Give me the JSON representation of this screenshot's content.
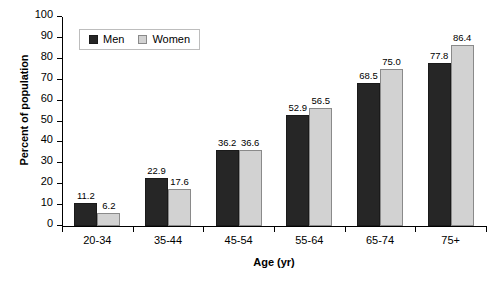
{
  "chart_data": {
    "type": "bar",
    "title": "",
    "subtitle": "",
    "xlabel": "Age (yr)",
    "ylabel": "Percent of population",
    "categories": [
      "20-34",
      "35-44",
      "45-54",
      "55-64",
      "65-74",
      "75+"
    ],
    "series": [
      {
        "name": "Men",
        "color": "#262626",
        "values": [
          11.2,
          22.9,
          36.2,
          52.9,
          68.5,
          77.8
        ]
      },
      {
        "name": "Women",
        "color": "#d2d2d2",
        "values": [
          6.2,
          17.6,
          36.6,
          56.5,
          75.0,
          86.4
        ]
      }
    ],
    "value_labels": {
      "Men": [
        "11.2",
        "22.9",
        "36.2",
        "52.9",
        "68.5",
        "77.8"
      ],
      "Women": [
        "6.2",
        "17.6",
        "36.6",
        "56.5",
        "75.0",
        "86.4"
      ]
    },
    "ylim": [
      0,
      100
    ],
    "ytick_values": [
      0,
      10,
      20,
      30,
      40,
      50,
      60,
      70,
      80,
      90,
      100
    ],
    "ytick_labels": [
      "0",
      "10",
      "20",
      "30",
      "40",
      "50",
      "60",
      "70",
      "80",
      "90",
      "100"
    ],
    "grid": false,
    "legend_position": "top-left",
    "legend_entries": [
      "Men",
      "Women"
    ]
  },
  "legend": {
    "men_label": "Men",
    "women_label": "Women"
  },
  "axes": {
    "x_title": "Age (yr)",
    "y_title": "Percent of population"
  }
}
